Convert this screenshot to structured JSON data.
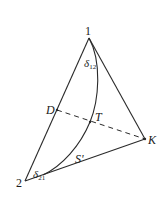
{
  "diagram": {
    "type": "ternary-phase-diagram",
    "colors": {
      "line": "#2a2a2a",
      "text": "#1a1a1a",
      "background": "#ffffff"
    },
    "vertices": {
      "v1": {
        "label": "1",
        "x": 89,
        "y": 38
      },
      "v2": {
        "label": "2",
        "x": 25,
        "y": 181
      },
      "vK": {
        "label": "K",
        "x": 145,
        "y": 139
      }
    },
    "points": {
      "D": {
        "label": "D",
        "x": 57,
        "y": 110
      },
      "T": {
        "label": "T",
        "x": 90,
        "y": 122
      }
    },
    "labels": {
      "curve": "S'",
      "delta12": {
        "base": "δ",
        "sub": "12"
      },
      "delta21": {
        "base": "δ",
        "sub": "21"
      }
    },
    "edges": [
      {
        "from": "1",
        "to": "2",
        "style": "solid"
      },
      {
        "from": "1",
        "to": "K",
        "style": "solid"
      },
      {
        "from": "2",
        "to": "K",
        "style": "solid"
      },
      {
        "from": "D",
        "to": "K",
        "style": "dashed"
      }
    ],
    "curve": {
      "name": "S'",
      "from": "1",
      "to": "2",
      "through": "T",
      "style": "solid"
    }
  }
}
